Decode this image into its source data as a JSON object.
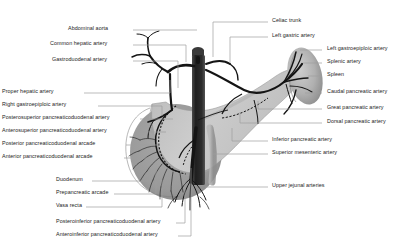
{
  "figure": {
    "background_color": "#ffffff",
    "text_color": "#1c1c1c",
    "leader_color": "#9d9d9d"
  },
  "palette": {
    "aorta": "#2b2b2b",
    "artery": "#141414",
    "pancreas": "#c9c9c9",
    "pancreas_head": "#bdbdbd",
    "duodenum": "#9b9b9b",
    "duodenum_dark": "#8a8a8a",
    "spleen": "#b2b2b2",
    "spleen_shadow": "#8f8f8f",
    "sma_vein": "#a8a8a8"
  },
  "labels_left": [
    {
      "id": "abdominal-aorta",
      "text": "Abdominal aorta",
      "x": 68,
      "y": 29,
      "lead": [
        [
          133,
          30
        ],
        [
          197,
          30
        ]
      ]
    },
    {
      "id": "common-hepatic-artery",
      "text": "Common hepatic artery",
      "x": 50,
      "y": 44,
      "lead": [
        [
          133,
          45
        ],
        [
          186,
          45
        ],
        [
          186,
          62
        ]
      ]
    },
    {
      "id": "gastroduodenal-artery",
      "text": "Gastroduodenal artery",
      "x": 52,
      "y": 60,
      "lead": [
        [
          133,
          61
        ],
        [
          178,
          61
        ],
        [
          178,
          88
        ]
      ]
    },
    {
      "id": "proper-hepatic-artery",
      "text": "Proper hepatic artery",
      "x": 2,
      "y": 92,
      "lead": [
        [
          84,
          93
        ],
        [
          170,
          93
        ],
        [
          170,
          80
        ]
      ]
    },
    {
      "id": "right-gastroepiploic-artery",
      "text": "Right gastroepiploic artery",
      "x": 2,
      "y": 105,
      "lead": [
        [
          98,
          106
        ],
        [
          162,
          106
        ],
        [
          162,
          116
        ]
      ]
    },
    {
      "id": "posterosuperior-pancreaticoduodenal-artery",
      "text": "Posterosuperior pancreaticoduodenal artery",
      "x": 2,
      "y": 118,
      "lead": [
        [
          140,
          119
        ],
        [
          173,
          119
        ]
      ]
    },
    {
      "id": "anterosuperior-pancreaticoduodenal-artery",
      "text": "Anterosuperior pancreaticoduodenal artery",
      "x": 2,
      "y": 131,
      "lead": [
        [
          140,
          132
        ],
        [
          166,
          132
        ]
      ]
    },
    {
      "id": "posterior-pancreaticoduodenal-arcade",
      "text": "Posterior pancreaticoduodenal arcade",
      "x": 2,
      "y": 144,
      "lead": [
        [
          126,
          145
        ],
        [
          160,
          145
        ]
      ]
    },
    {
      "id": "anterior-pancreaticoduodenal-arcade",
      "text": "Anterior pancreaticoduodenal arcade",
      "x": 2,
      "y": 157,
      "lead": [
        [
          124,
          158
        ],
        [
          154,
          158
        ]
      ]
    },
    {
      "id": "duodenum",
      "text": "Duodenum",
      "x": 56,
      "y": 180,
      "lead": [
        [
          92,
          181
        ],
        [
          150,
          181
        ],
        [
          150,
          170
        ]
      ]
    },
    {
      "id": "prepancreatic-arcade",
      "text": "Prepancreatic arcade",
      "x": 56,
      "y": 193,
      "lead": [
        [
          114,
          194
        ],
        [
          156,
          194
        ],
        [
          156,
          168
        ]
      ]
    },
    {
      "id": "vasa-recta",
      "text": "Vasa recta",
      "x": 56,
      "y": 206,
      "lead": [
        [
          86,
          207
        ],
        [
          162,
          207
        ],
        [
          162,
          180
        ]
      ]
    },
    {
      "id": "posteroinferior-pancreaticoduodenal-artery",
      "text": "Posteroinferior pancreaticoduodenal artery",
      "x": 56,
      "y": 222,
      "lead": [
        [
          176,
          223
        ],
        [
          185,
          223
        ],
        [
          185,
          172
        ]
      ]
    },
    {
      "id": "anteroinferior-pancreaticoduodenal-artery",
      "text": "Anteroinferior pancreaticoduodenal artery",
      "x": 56,
      "y": 235,
      "lead": [
        [
          178,
          236
        ],
        [
          191,
          236
        ],
        [
          191,
          168
        ]
      ]
    }
  ],
  "labels_right": [
    {
      "id": "celiac-trunk",
      "text": "Celiac trunk",
      "x": 272,
      "y": 21,
      "lead": [
        [
          268,
          22
        ],
        [
          213,
          22
        ],
        [
          213,
          57
        ]
      ]
    },
    {
      "id": "left-gastric-artery",
      "text": "Left gastric artery",
      "x": 272,
      "y": 36,
      "lead": [
        [
          268,
          37
        ],
        [
          230,
          37
        ],
        [
          230,
          63
        ]
      ]
    },
    {
      "id": "left-gastroepiploic-artery",
      "text": "Left gastroepiploic artery",
      "x": 327,
      "y": 49,
      "lead": [
        [
          322,
          50
        ],
        [
          300,
          50
        ]
      ]
    },
    {
      "id": "splenic-artery",
      "text": "Splenic artery",
      "x": 327,
      "y": 62,
      "lead": [
        [
          322,
          63
        ],
        [
          303,
          63
        ]
      ]
    },
    {
      "id": "spleen",
      "text": "Spleen",
      "x": 327,
      "y": 75,
      "lead": [
        [
          322,
          76
        ],
        [
          308,
          76
        ]
      ]
    },
    {
      "id": "caudal-pancreatic-artery",
      "text": "Caudal pancreatic artery",
      "x": 327,
      "y": 92,
      "lead": [
        [
          322,
          93
        ],
        [
          305,
          93
        ]
      ]
    },
    {
      "id": "great-pancreatic-artery",
      "text": "Great pancreatic artery",
      "x": 327,
      "y": 108,
      "lead": [
        [
          322,
          109
        ],
        [
          258,
          109
        ],
        [
          258,
          101
        ]
      ]
    },
    {
      "id": "dorsal-pancreatic-artery",
      "text": "Dorsal pancreatic artery",
      "x": 327,
      "y": 122,
      "lead": [
        [
          322,
          123
        ],
        [
          240,
          123
        ],
        [
          240,
          112
        ]
      ]
    },
    {
      "id": "inferior-pancreatic-artery",
      "text": "Inferior pancreatic artery",
      "x": 272,
      "y": 140,
      "lead": [
        [
          268,
          141
        ],
        [
          232,
          141
        ],
        [
          232,
          128
        ]
      ]
    },
    {
      "id": "superior-mesenteric-artery",
      "text": "Superior mesenteric artery",
      "x": 272,
      "y": 153,
      "lead": [
        [
          268,
          154
        ],
        [
          212,
          154
        ]
      ]
    },
    {
      "id": "upper-jejunal-arteries",
      "text": "Upper jejunal arteries",
      "x": 272,
      "y": 186,
      "lead": [
        [
          268,
          187
        ],
        [
          205,
          187
        ]
      ]
    }
  ],
  "anatomy": {
    "structures": [
      "abdominal aorta",
      "celiac trunk",
      "common hepatic artery",
      "proper hepatic artery",
      "left gastric artery",
      "splenic artery",
      "gastroduodenal artery",
      "right gastroepiploic artery",
      "left gastroepiploic artery",
      "superior mesenteric artery",
      "jejunal arteries",
      "pancreaticoduodenal arcades",
      "pancreas",
      "duodenum",
      "spleen"
    ]
  }
}
